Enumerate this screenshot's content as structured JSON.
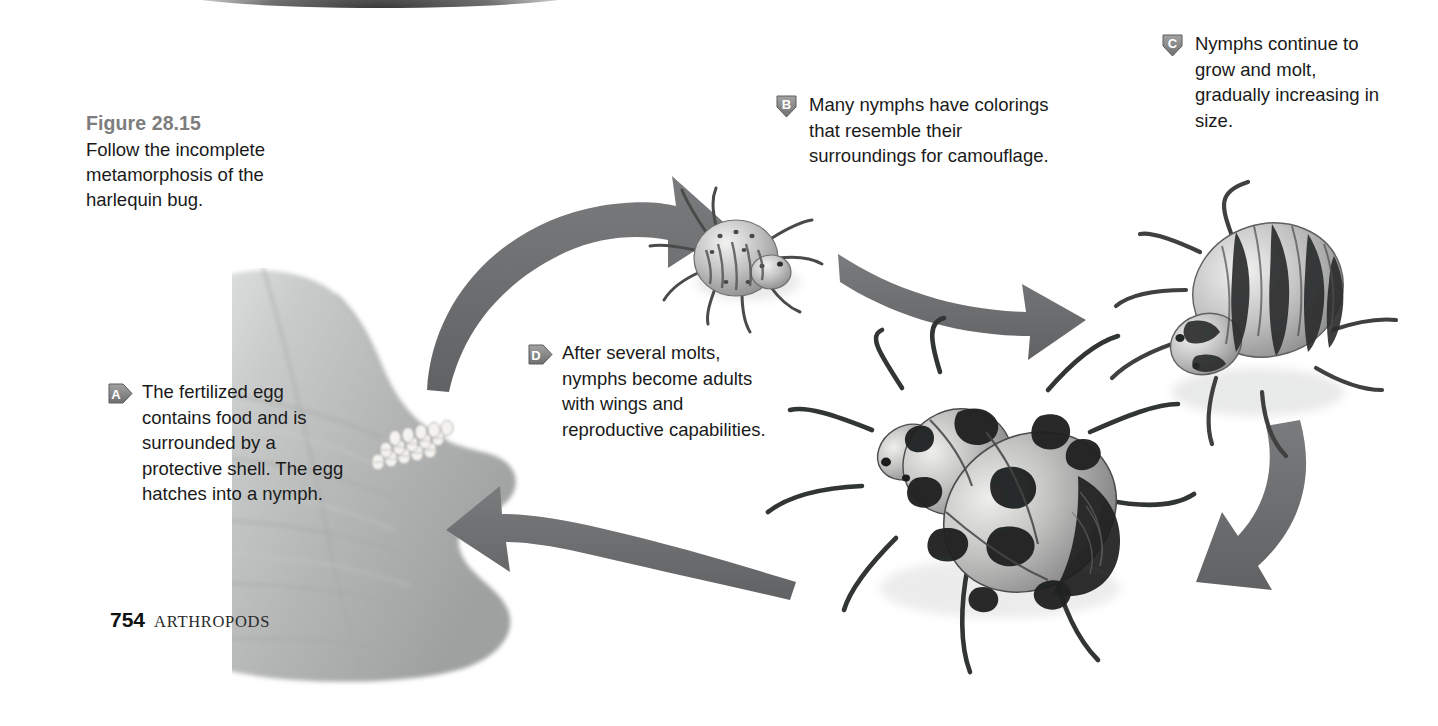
{
  "figure": {
    "title": "Figure 28.15",
    "description": "Follow the incomplete metamorphosis of the harlequin bug."
  },
  "callouts": [
    {
      "letter": "A",
      "badge_direction": "right",
      "text": "The fertilized egg contains food and is surrounded by a protective shell. The egg hatches into a nymph."
    },
    {
      "letter": "B",
      "badge_direction": "down",
      "text": "Many nymphs have colorings that resemble their surroundings for camouflage."
    },
    {
      "letter": "C",
      "badge_direction": "down",
      "text": "Nymphs continue to grow and molt, gradually increasing in size."
    },
    {
      "letter": "D",
      "badge_direction": "right",
      "text": "After several molts, nymphs become adults with wings and reproductive capabilities."
    }
  ],
  "footer": {
    "page_number": "754",
    "section": "ARTHROPODS"
  },
  "artwork": {
    "leaf": "cabbage-leaf-with-egg-cluster",
    "egg_cluster": "harlequin-bug-eggs",
    "small_nymph": "early-instar-nymph",
    "large_nymph": "late-instar-nymph",
    "adult": "adult-harlequin-bug",
    "arrows": [
      "arrow-eggs-to-nymph",
      "arrow-nymph-to-large-nymph",
      "arrow-large-nymph-to-adult",
      "arrow-adult-to-eggs"
    ]
  },
  "colors": {
    "arrow_gray": "#6f7072",
    "badge_gray": "#8a8a8a",
    "title_gray": "#7d7d7d",
    "text_black": "#1a1a1a",
    "leaf_gray": "#b9bbbb"
  }
}
